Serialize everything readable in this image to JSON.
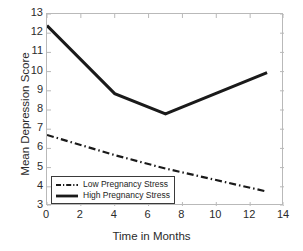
{
  "chart_data": {
    "type": "line",
    "title": "",
    "xlabel": "Time in Months",
    "ylabel": "Mean Depression Score",
    "xlim": [
      0,
      14
    ],
    "ylim": [
      3,
      13
    ],
    "xticks": [
      0,
      2,
      4,
      6,
      8,
      10,
      12,
      14
    ],
    "yticks": [
      3,
      4,
      5,
      6,
      7,
      8,
      9,
      10,
      11,
      12,
      13
    ],
    "grid": false,
    "legend_position": "lower left (inside axes)",
    "series": [
      {
        "name": "Low Pregnancy Stress",
        "style": "dash-dot",
        "color": "#1a1a1a",
        "x": [
          0,
          4,
          7,
          13
        ],
        "values": [
          6.7,
          5.65,
          4.95,
          3.75
        ]
      },
      {
        "name": "High Pregnancy Stress",
        "style": "solid",
        "color": "#1a1a1a",
        "x": [
          0,
          4,
          7,
          13
        ],
        "values": [
          12.4,
          8.85,
          7.8,
          9.95
        ]
      }
    ]
  },
  "axis": {
    "xtick_labels": [
      "0",
      "2",
      "4",
      "6",
      "8",
      "10",
      "12",
      "14"
    ],
    "ytick_labels": [
      "3",
      "4",
      "5",
      "6",
      "7",
      "8",
      "9",
      "10",
      "11",
      "12",
      "13"
    ],
    "xlabel": "Time in Months",
    "ylabel": "Mean Depression Score",
    "frame_color": "#b9b9b9"
  },
  "legend": {
    "entries": [
      {
        "label": "Low Pregnancy Stress",
        "style": "dash-dot"
      },
      {
        "label": "High Pregnancy Stress",
        "style": "solid"
      }
    ]
  }
}
